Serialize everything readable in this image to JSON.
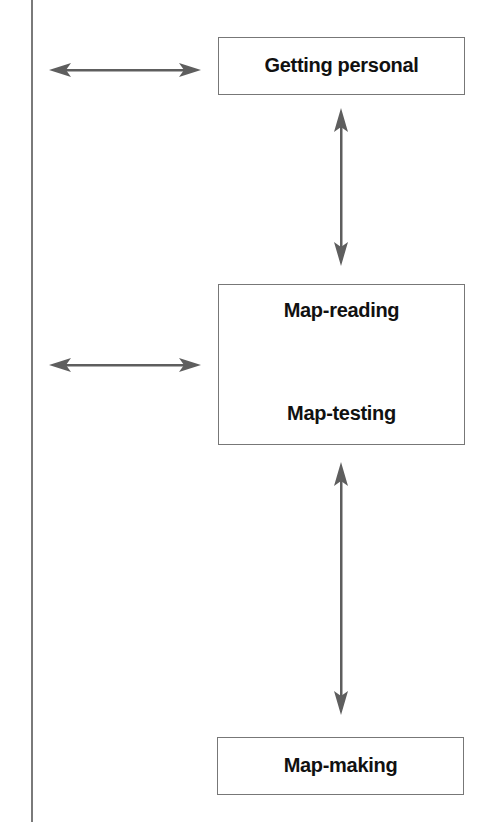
{
  "diagram": {
    "nodes": [
      {
        "id": "getting-personal",
        "label": "Getting personal"
      },
      {
        "id": "map-reading-testing",
        "labels": [
          "Map-reading",
          "Map-testing"
        ]
      },
      {
        "id": "map-making",
        "label": "Map-making"
      }
    ],
    "edges": [
      {
        "from": "left-line",
        "to": "getting-personal",
        "type": "bidirectional"
      },
      {
        "from": "getting-personal",
        "to": "map-reading-testing",
        "type": "bidirectional"
      },
      {
        "from": "left-line",
        "to": "map-reading-testing",
        "type": "bidirectional"
      },
      {
        "from": "map-reading-testing",
        "to": "map-making",
        "type": "bidirectional"
      }
    ],
    "colors": {
      "line": "#6e6e6e",
      "box_border": "#777777",
      "text": "#111111"
    }
  }
}
